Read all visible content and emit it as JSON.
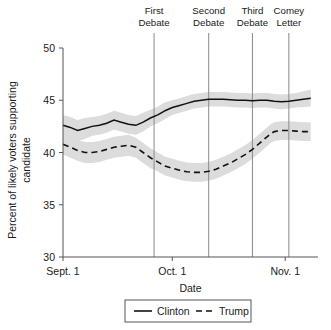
{
  "chart_data": {
    "type": "line",
    "title": "",
    "xlabel": "Date",
    "ylabel": "Percent of likely voters supporting candidate",
    "ylabel_line1": "Percent of likely voters supporting",
    "ylabel_line2": "candidate",
    "ylim": [
      30,
      50
    ],
    "yticks": [
      30,
      35,
      40,
      45,
      50
    ],
    "ytick_labels": [
      "30",
      "35",
      "40",
      "45",
      "50"
    ],
    "xlim": [
      0,
      70
    ],
    "xticks": [
      0,
      30,
      61
    ],
    "xtick_labels": [
      "Sept. 1",
      "Oct. 1",
      "Nov. 1"
    ],
    "grid": false,
    "legend_position": "bottom",
    "x_unit": "days since Sept. 1",
    "x": [
      0,
      2,
      4,
      6,
      8,
      10,
      12,
      14,
      16,
      18,
      20,
      22,
      24,
      26,
      27,
      28,
      30,
      32,
      34,
      36,
      38,
      40,
      42,
      44,
      46,
      48,
      50,
      52,
      54,
      56,
      57,
      58,
      60,
      62,
      64,
      66,
      68
    ],
    "series": [
      {
        "name": "Clinton",
        "style": "solid",
        "values": [
          42.6,
          42.4,
          42.1,
          42.3,
          42.5,
          42.6,
          42.8,
          43.1,
          42.9,
          42.7,
          42.6,
          42.9,
          43.3,
          43.6,
          43.8,
          44.0,
          44.3,
          44.5,
          44.7,
          44.9,
          45.0,
          45.1,
          45.1,
          45.1,
          45.05,
          45.0,
          45.0,
          44.95,
          45.0,
          45.0,
          44.95,
          44.9,
          44.85,
          44.9,
          45.0,
          45.1,
          45.2
        ],
        "band_upper": [
          43.6,
          43.4,
          43.1,
          43.3,
          43.4,
          43.5,
          43.7,
          44.0,
          43.8,
          43.6,
          43.5,
          43.8,
          44.1,
          44.4,
          44.6,
          44.8,
          45.0,
          45.2,
          45.4,
          45.6,
          45.7,
          45.8,
          45.8,
          45.8,
          45.75,
          45.7,
          45.7,
          45.65,
          45.7,
          45.7,
          45.65,
          45.6,
          45.55,
          45.6,
          45.7,
          45.85,
          46.0
        ],
        "band_lower": [
          41.6,
          41.4,
          41.1,
          41.3,
          41.6,
          41.7,
          41.9,
          42.2,
          42.0,
          41.8,
          41.7,
          42.0,
          42.5,
          42.8,
          43.0,
          43.2,
          43.6,
          43.8,
          44.0,
          44.2,
          44.3,
          44.4,
          44.4,
          44.4,
          44.35,
          44.3,
          44.3,
          44.25,
          44.3,
          44.3,
          44.25,
          44.2,
          44.15,
          44.2,
          44.3,
          44.35,
          44.4
        ]
      },
      {
        "name": "Trump",
        "style": "dashed",
        "values": [
          40.8,
          40.5,
          40.2,
          40.0,
          40.0,
          40.1,
          40.3,
          40.5,
          40.6,
          40.7,
          40.5,
          40.0,
          39.5,
          39.1,
          38.9,
          38.7,
          38.5,
          38.3,
          38.15,
          38.1,
          38.1,
          38.2,
          38.4,
          38.7,
          39.0,
          39.4,
          39.8,
          40.3,
          40.9,
          41.5,
          41.8,
          42.0,
          42.1,
          42.1,
          42.05,
          42.0,
          42.0
        ],
        "band_upper": [
          41.8,
          41.5,
          41.2,
          41.0,
          41.0,
          41.1,
          41.3,
          41.5,
          41.6,
          41.7,
          41.4,
          40.9,
          40.4,
          40.0,
          39.8,
          39.6,
          39.4,
          39.2,
          39.05,
          39.0,
          39.0,
          39.1,
          39.3,
          39.6,
          39.9,
          40.3,
          40.7,
          41.2,
          41.8,
          42.4,
          42.7,
          42.9,
          43.0,
          43.0,
          42.95,
          42.9,
          42.9
        ],
        "band_lower": [
          39.8,
          39.5,
          39.2,
          39.0,
          39.0,
          39.1,
          39.3,
          39.5,
          39.6,
          39.7,
          39.5,
          39.0,
          38.5,
          38.2,
          38.0,
          37.8,
          37.6,
          37.4,
          37.25,
          37.2,
          37.2,
          37.3,
          37.5,
          37.8,
          38.1,
          38.5,
          38.9,
          39.4,
          40.0,
          40.6,
          40.9,
          41.1,
          41.2,
          41.2,
          41.15,
          41.1,
          41.1
        ]
      }
    ],
    "annotations": [
      {
        "id": "first-debate",
        "label_line1": "First",
        "label_line2": "Debate",
        "x": 25
      },
      {
        "id": "second-debate",
        "label_line1": "Second",
        "label_line2": "Debate",
        "x": 40
      },
      {
        "id": "third-debate",
        "label_line1": "Third",
        "label_line2": "Debate",
        "x": 52
      },
      {
        "id": "comey-letter",
        "label_line1": "Comey",
        "label_line2": "Letter",
        "x": 62
      }
    ],
    "legend": [
      {
        "label": "Clinton",
        "style": "solid"
      },
      {
        "label": "Trump",
        "style": "dashed"
      }
    ],
    "colors": {
      "line": "#111111",
      "band": "#dcdcdc",
      "axis": "#555555",
      "event_line": "#8a8a8a",
      "background": "#ffffff"
    }
  }
}
